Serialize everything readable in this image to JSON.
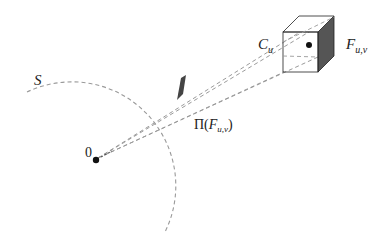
{
  "diagram": {
    "labels": {
      "sphere": "S",
      "origin": "0",
      "cube": "C",
      "cube_sub": "u",
      "face": "F",
      "face_sub": "u,v",
      "projection_prefix": "Π(",
      "projection_face": "F",
      "projection_sub": "u,v",
      "projection_suffix": ")"
    },
    "colors": {
      "line": "#222222",
      "dashed": "#9a9a9a",
      "shaded_face": "#555555",
      "projected_patch": "#444444"
    },
    "elements": [
      {
        "type": "sphere-arc",
        "label": "S",
        "style": "dashed"
      },
      {
        "type": "point",
        "label": "0"
      },
      {
        "type": "cube",
        "label": "C_u"
      },
      {
        "type": "face",
        "label": "F_{u,v}"
      },
      {
        "type": "projected-patch",
        "label": "Π(F_{u,v})"
      },
      {
        "type": "projection-rays",
        "count": 4,
        "style": "dashed"
      }
    ]
  }
}
